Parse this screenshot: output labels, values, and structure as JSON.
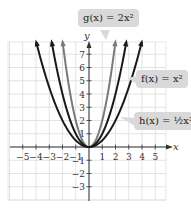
{
  "chart_data": {
    "type": "line",
    "title": "",
    "xlabel": "x",
    "ylabel": "y",
    "xlim": [
      -6,
      6
    ],
    "ylim": [
      -4,
      8
    ],
    "grid": true,
    "x_ticks": [
      -5,
      -4,
      -3,
      -2,
      -1,
      1,
      2,
      3,
      4,
      5
    ],
    "y_ticks": [
      -3,
      -2,
      -1,
      1,
      2,
      3,
      4,
      5,
      6,
      7
    ],
    "series": [
      {
        "name": "g(x) = 2x²",
        "formula": "2x^2",
        "coefficient": 2,
        "color": "#7a7a7a",
        "x": [
          -2,
          -1,
          0,
          1,
          2
        ],
        "values": [
          8,
          2,
          0,
          2,
          8
        ]
      },
      {
        "name": "f(x) = x²",
        "formula": "x^2",
        "coefficient": 1,
        "color": "#1a1a1a",
        "x": [
          -3,
          -2,
          -1,
          0,
          1,
          2,
          3
        ],
        "values": [
          9,
          4,
          1,
          0,
          1,
          4,
          9
        ]
      },
      {
        "name": "h(x) = ½x²",
        "formula": "(1/2)x^2",
        "coefficient": 0.5,
        "color": "#1a1a1a",
        "x": [
          -4,
          -3,
          -2,
          -1,
          0,
          1,
          2,
          3,
          4
        ],
        "values": [
          8,
          4.5,
          2,
          0.5,
          0,
          0.5,
          2,
          4.5,
          8
        ]
      }
    ],
    "annotations": [
      "g(x) = 2x²",
      "f(x) = x²",
      "h(x) = ½x²"
    ]
  },
  "labels": {
    "g": "g(x) = 2x²",
    "f": "f(x) = x²",
    "h": "h(x) = ½x²"
  },
  "axes": {
    "x_name": "x",
    "y_name": "y"
  }
}
